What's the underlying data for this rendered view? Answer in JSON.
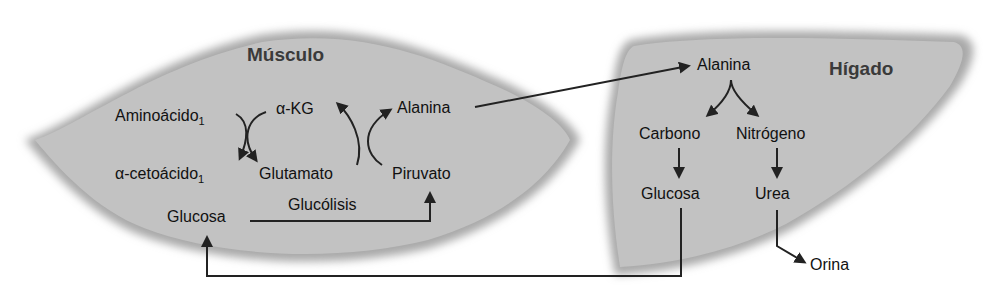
{
  "muscle": {
    "title": "Músculo",
    "aminoacid": "Aminoácido",
    "aminoacid_sub": "1",
    "akg": "α-KG",
    "alanine": "Alanina",
    "ketoacid": "α-cetoácido",
    "ketoacid_sub": "1",
    "glutamate": "Glutamato",
    "pyruvate": "Piruvato",
    "glycolysis": "Glucólisis",
    "glucose": "Glucosa"
  },
  "liver": {
    "title": "Hígado",
    "alanine": "Alanina",
    "carbon": "Carbono",
    "nitrogen": "Nitrógeno",
    "glucose": "Glucosa",
    "urea": "Urea",
    "urine": "Orina"
  },
  "colors": {
    "organ_fill": "#bdbdbd",
    "arrow": "#222222",
    "title_text": "#3a3a3a"
  }
}
